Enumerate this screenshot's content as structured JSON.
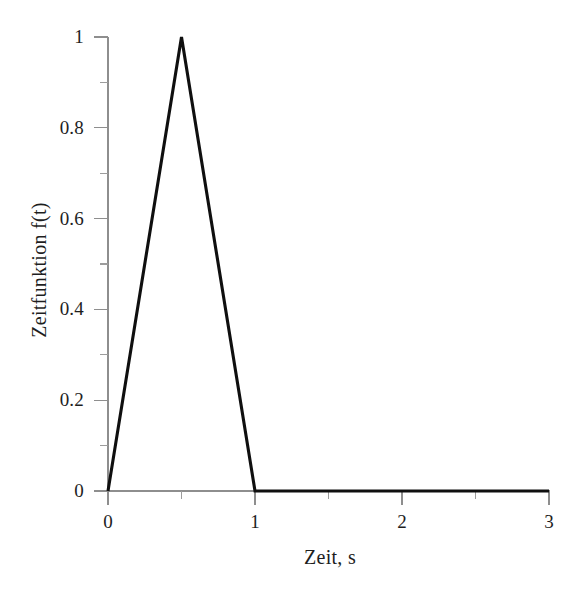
{
  "figure": {
    "background_color": "#ffffff",
    "curve_color": "#0d0d0d",
    "axis_color": "#8d8d8d"
  },
  "chart_data": {
    "type": "line",
    "title": "",
    "subtitle": "",
    "xlabel": "Zeit, s",
    "ylabel": "Zeitfunktion f(t)",
    "xlim": [
      0,
      3
    ],
    "ylim": [
      0,
      1
    ],
    "grid": false,
    "legend": null,
    "legend_position": "none",
    "x_major_ticks": [
      0,
      1,
      2,
      3
    ],
    "x_major_tick_labels": [
      "0",
      "1",
      "2",
      "3"
    ],
    "x_minor_ticks": [
      0.5,
      1.5,
      2.5
    ],
    "y_major_ticks": [
      0,
      0.2,
      0.4,
      0.6,
      0.8,
      1
    ],
    "y_major_tick_labels": [
      "0",
      "0.2",
      "0.4",
      "0.6",
      "0.8",
      "1"
    ],
    "y_minor_ticks": [
      0.1,
      0.3,
      0.5,
      0.7,
      0.9
    ],
    "series": [
      {
        "name": "f(t)",
        "color": "#0d0d0d",
        "x": [
          0,
          0.5,
          1,
          3
        ],
        "y": [
          0,
          1,
          0,
          0
        ],
        "description": "Dreieckimpuls: linearer Anstieg von 0 auf 1 zwischen t=0 und t=0.5 s, linearer Abfall auf 0 bis t=1 s, danach konstant 0 bis t=3 s"
      }
    ],
    "annotations": []
  }
}
